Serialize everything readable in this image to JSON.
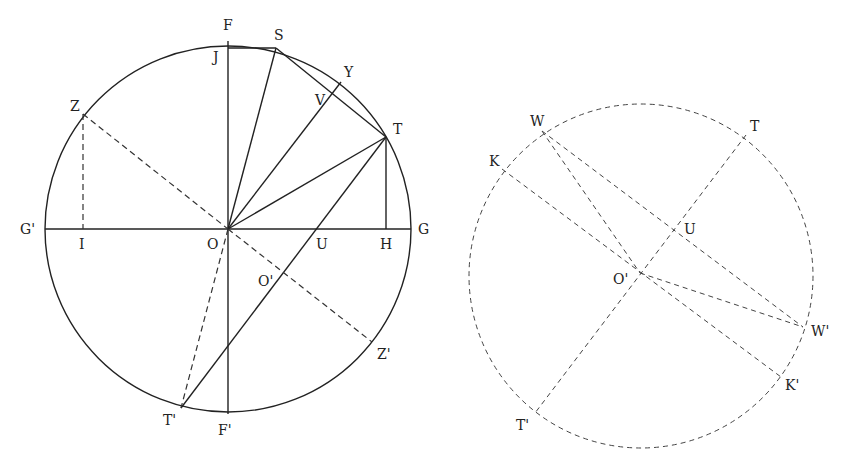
{
  "left_figure": {
    "circle": {
      "cx": 228,
      "cy": 229,
      "r": 183
    },
    "labels": {
      "F": "F",
      "S": "S",
      "J": "J",
      "Y": "Y",
      "V": "V",
      "T": "T",
      "Z": "Z",
      "G_prime": "G'",
      "I": "I",
      "O": "O",
      "U": "U",
      "H": "H",
      "G": "G",
      "O_prime": "O'",
      "Z_prime": "Z'",
      "T_prime": "T'",
      "F_prime": "F'"
    }
  },
  "right_figure": {
    "circle": {
      "cx": 641,
      "cy": 276,
      "r": 172
    },
    "labels": {
      "W": "W",
      "T": "T",
      "K": "K",
      "U": "U",
      "O_prime": "O'",
      "W_prime": "W'",
      "K_prime": "K'",
      "T_prime": "T'"
    }
  }
}
